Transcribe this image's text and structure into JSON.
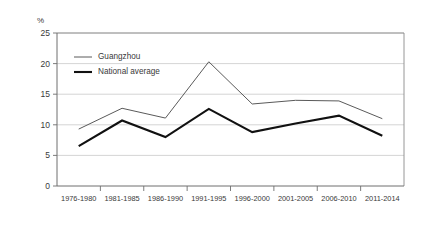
{
  "chart_data": {
    "type": "line",
    "title": "",
    "subtitle": "",
    "xlabel": "",
    "ylabel": "",
    "unit_label": "%",
    "categories": [
      "1976-1980",
      "1981-1985",
      "1986-1990",
      "1991-1995",
      "1996-2000",
      "2001-2005",
      "2006-2010",
      "2011-2014"
    ],
    "series": [
      {
        "name": "Guangzhou",
        "color": "#5a5a5a",
        "line_width": 1.0,
        "values": [
          9.3,
          12.7,
          11.1,
          20.3,
          13.4,
          14.0,
          13.9,
          11.0
        ]
      },
      {
        "name": "National average",
        "color": "#111111",
        "line_width": 2.1,
        "values": [
          6.5,
          10.7,
          8.0,
          12.6,
          8.8,
          10.2,
          11.5,
          8.2
        ]
      }
    ],
    "ylim": [
      0,
      25
    ],
    "yticks": [
      0,
      5,
      10,
      15,
      20,
      25
    ],
    "ytick_labels": [
      "0",
      "5",
      "10",
      "15",
      "20",
      "25"
    ],
    "grid": true,
    "grid_axis": "y",
    "legend_position": "inside-top-left",
    "legend_entries": [
      {
        "label": "Guangzhou",
        "color": "#5a5a5a",
        "line_width": 1.0
      },
      {
        "label": "National average",
        "color": "#111111",
        "line_width": 2.1
      }
    ]
  }
}
